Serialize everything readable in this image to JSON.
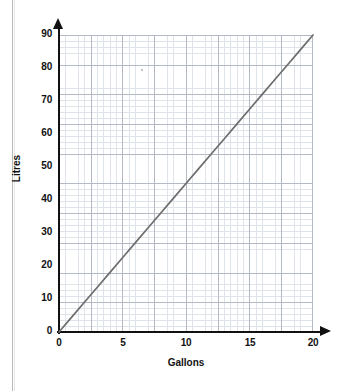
{
  "chart_data": {
    "type": "line",
    "title": "",
    "subtitle": "",
    "xlabel": "Gallons",
    "ylabel": "Litres",
    "xlim": [
      0,
      20
    ],
    "ylim": [
      0,
      90
    ],
    "xticks": [
      "0",
      "5",
      "10",
      "15",
      "20"
    ],
    "xtick_values": [
      0,
      5,
      10,
      15,
      20
    ],
    "yticks": [
      "0",
      "10",
      "20",
      "30",
      "40",
      "50",
      "60",
      "70",
      "80",
      "90"
    ],
    "ytick_values": [
      0,
      10,
      20,
      30,
      40,
      50,
      60,
      70,
      80,
      90
    ],
    "grid": true,
    "grid_minor": true,
    "legend": false,
    "legend_position": "none",
    "series": [
      {
        "name": "Gallons to Litres conversion",
        "color": "#6d6d6d",
        "x": [
          0,
          1,
          2,
          3,
          4,
          5,
          6,
          7,
          8,
          9,
          10,
          11,
          12,
          13,
          14,
          15,
          16,
          17,
          18,
          19,
          20
        ],
        "values": [
          0,
          4.5,
          9,
          13.5,
          18,
          22.5,
          27,
          31.5,
          36,
          40.5,
          45,
          49.5,
          54,
          58.5,
          63,
          67.5,
          72,
          76.5,
          81,
          85.5,
          90
        ]
      }
    ],
    "annotations": []
  },
  "axes": {
    "y_title": "Litres",
    "x_title": "Gallons",
    "y_labels": [
      "90",
      "80",
      "70",
      "60",
      "50",
      "40",
      "30",
      "20",
      "10",
      "0"
    ],
    "x_labels": [
      "0",
      "5",
      "10",
      "15",
      "20"
    ]
  },
  "colors": {
    "line": "#6d6d6d",
    "axis": "#111111",
    "grid_major": "#b3bac6",
    "grid_minor": "#dfe3ea",
    "background": "#ffffff",
    "page_edge": "#b9b9b9"
  }
}
